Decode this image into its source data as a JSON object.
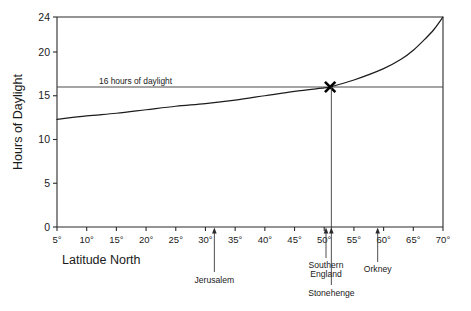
{
  "chart_data": {
    "type": "line",
    "title": "",
    "xlabel": "Latitude North",
    "ylabel": "Hours of Daylight",
    "xlim": [
      5,
      70
    ],
    "ylim": [
      0,
      24
    ],
    "grid": false,
    "legend": "none",
    "x_ticks": [
      {
        "value": 5,
        "label": "5°"
      },
      {
        "value": 10,
        "label": "10°"
      },
      {
        "value": 15,
        "label": "15°"
      },
      {
        "value": 20,
        "label": "20°"
      },
      {
        "value": 25,
        "label": "25°"
      },
      {
        "value": 30,
        "label": "30°"
      },
      {
        "value": 35,
        "label": "35°"
      },
      {
        "value": 40,
        "label": "40°"
      },
      {
        "value": 45,
        "label": "45°"
      },
      {
        "value": 50,
        "label": "50°"
      },
      {
        "value": 55,
        "label": "55°"
      },
      {
        "value": 60,
        "label": "60°"
      },
      {
        "value": 65,
        "label": "65°"
      },
      {
        "value": 70,
        "label": "70°"
      }
    ],
    "y_ticks": [
      {
        "value": 0,
        "label": "0"
      },
      {
        "value": 5,
        "label": "5"
      },
      {
        "value": 10,
        "label": "10"
      },
      {
        "value": 15,
        "label": "15"
      },
      {
        "value": 20,
        "label": "20"
      },
      {
        "value": 24,
        "label": "24"
      }
    ],
    "series": [
      {
        "name": "Hours of daylight at summer solstice",
        "color": "#1c1c1c",
        "points": [
          {
            "x": 5,
            "y": 12.3
          },
          {
            "x": 10,
            "y": 12.7
          },
          {
            "x": 15,
            "y": 13.0
          },
          {
            "x": 20,
            "y": 13.4
          },
          {
            "x": 25,
            "y": 13.8
          },
          {
            "x": 30,
            "y": 14.1
          },
          {
            "x": 35,
            "y": 14.5
          },
          {
            "x": 40,
            "y": 15.0
          },
          {
            "x": 45,
            "y": 15.5
          },
          {
            "x": 50,
            "y": 15.9
          },
          {
            "x": 51,
            "y": 16.0
          },
          {
            "x": 55,
            "y": 16.8
          },
          {
            "x": 60,
            "y": 18.1
          },
          {
            "x": 63,
            "y": 19.2
          },
          {
            "x": 65,
            "y": 20.2
          },
          {
            "x": 67,
            "y": 21.5
          },
          {
            "x": 68.5,
            "y": 22.6
          },
          {
            "x": 70,
            "y": 24.0
          }
        ]
      }
    ],
    "reference_line": {
      "label": "16 hours of daylight",
      "y": 16,
      "color": "#4a4a4a"
    },
    "markers": [
      {
        "name": "intersection-marker",
        "symbol": "X",
        "x": 51,
        "y": 16
      }
    ],
    "annotations": [
      {
        "name": "jerusalem",
        "label": "Jerusalem",
        "x": 31.5,
        "label_lines": [
          "Jerusalem"
        ]
      },
      {
        "name": "southern-england",
        "label": "Southern England",
        "x": 50.3,
        "label_lines": [
          "Southern",
          "England"
        ]
      },
      {
        "name": "stonehenge",
        "label": "Stonehenge",
        "x": 51.2,
        "label_lines": [
          "Stonehenge"
        ]
      },
      {
        "name": "orkney",
        "label": "Orkney",
        "x": 59.0,
        "label_lines": [
          "Orkney"
        ]
      }
    ]
  }
}
